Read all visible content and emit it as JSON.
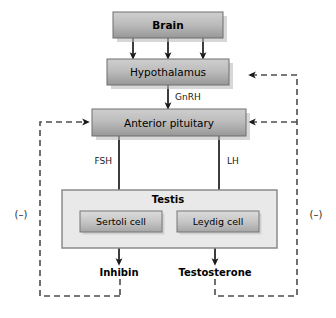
{
  "diagram": {
    "title_nodes": {
      "brain": "Brain",
      "hypothalamus": "Hypothalamus",
      "anterior_pituitary": "Anterior pituitary",
      "testis": "Testis",
      "sertoli_cell": "Sertoli cell",
      "leydig_cell": "Leydig cell",
      "inhibin": "Inhibin",
      "testosterone": "Testosterone"
    },
    "signals": {
      "gnrh": "GnRH",
      "fsh": "FSH",
      "lh": "LH"
    },
    "feedback": {
      "left_sign": "(–)",
      "right_sign": "(–)"
    },
    "colors": {
      "box_fill_top": "#c8c8c8",
      "box_fill_bottom": "#9a9a9a",
      "box_stroke": "#6e6e6e",
      "cell_fill_top": "#d2d2d2",
      "cell_fill_bottom": "#a8a8a8",
      "testis_fill": "#e8e8e8",
      "testis_stroke": "#8a8a8a",
      "shadow": "#bdbdbd",
      "arrow": "#1a1a1a",
      "dashed": "#4d4d4d",
      "text": "#000000"
    }
  }
}
